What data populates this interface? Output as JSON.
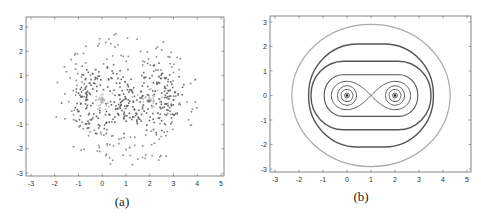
{
  "figure": {
    "panels": [
      {
        "id": "a",
        "caption": "(a)"
      },
      {
        "id": "b",
        "caption": "(b)"
      }
    ]
  },
  "chart_data": [
    {
      "type": "scatter",
      "title": "",
      "caption": "(a)",
      "xlabel": "",
      "ylabel": "",
      "xlim": [
        -3,
        5
      ],
      "ylim": [
        -3,
        3
      ],
      "xticks": [
        -3,
        -2,
        -1,
        0,
        1,
        2,
        3,
        4,
        5
      ],
      "yticks": [
        -3,
        -2,
        -1,
        0,
        1,
        2,
        3
      ],
      "grid": false,
      "description": "Scatter of sample points distributed around two centers at (0,0) and (2,0); dense dark rings near radius ~1 around each center, lighter points close to centers, sparse points out to radius ~3",
      "centers": [
        [
          0,
          0
        ],
        [
          2,
          0
        ]
      ],
      "point_color": "#777777",
      "center_color": "#bbbbbb"
    },
    {
      "type": "contour",
      "title": "",
      "caption": "(b)",
      "xlabel": "",
      "ylabel": "",
      "xlim": [
        -3,
        5
      ],
      "ylim": [
        -3,
        3
      ],
      "xticks": [
        -3,
        -2,
        -1,
        0,
        1,
        2,
        3,
        4,
        5
      ],
      "yticks": [
        -3,
        -2,
        -1,
        0,
        1,
        2,
        3
      ],
      "grid": false,
      "description": "Level sets of a two-well function with minima at (0,0) and (2,0); figure-eight separatrix crossing at (1,0); nested closed curves around the pair; outermost light gray circle",
      "minima": [
        [
          0,
          0
        ],
        [
          2,
          0
        ]
      ],
      "saddle": [
        1,
        0
      ],
      "contours": [
        {
          "label": "inner ring around minima",
          "radius": 0.1
        },
        {
          "label": "ring around minima",
          "radius": 0.25
        },
        {
          "label": "ring around minima",
          "radius": 0.4
        },
        {
          "label": "figure-eight separatrix",
          "x_extent": [
            -0.65,
            2.65
          ],
          "y_extent": [
            -0.45,
            0.45
          ]
        },
        {
          "label": "level 1",
          "x_extent": [
            -0.95,
            2.95
          ],
          "y_extent": [
            -0.85,
            0.85
          ]
        },
        {
          "label": "level 2",
          "x_extent": [
            -1.5,
            3.5
          ],
          "y_extent": [
            -1.4,
            1.4
          ]
        },
        {
          "label": "level 3",
          "x_extent": [
            -1.6,
            3.6
          ],
          "y_extent": [
            -2.1,
            2.1
          ]
        },
        {
          "label": "outer light circle",
          "x_extent": [
            -2.3,
            4.3
          ],
          "y_extent": [
            -2.9,
            2.9
          ]
        }
      ],
      "line_color": "#555555",
      "outer_line_color": "#aaaaaa"
    }
  ]
}
